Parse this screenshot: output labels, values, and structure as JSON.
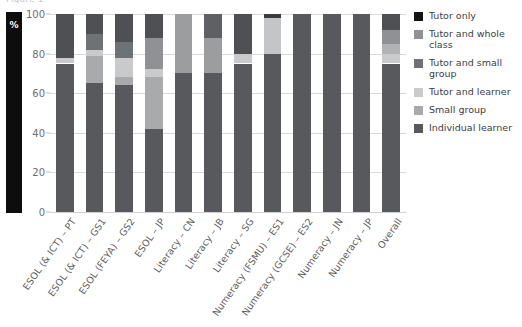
{
  "figure": {
    "caption_sliver": "Figure 1",
    "y_axis_title": "%"
  },
  "axis": {
    "y_ticks": [
      0,
      20,
      40,
      60,
      80,
      100
    ],
    "y_min": 0,
    "y_max": 100,
    "grid": true
  },
  "legend": {
    "position": "right",
    "entries": [
      {
        "label": "Tutor only",
        "color": "#141414"
      },
      {
        "label": "Tutor and whole\nclass",
        "color": "#8f9194"
      },
      {
        "label": "Tutor and small\ngroup",
        "color": "#6f7275"
      },
      {
        "label": "Tutor and learner",
        "color": "#c9cacb"
      },
      {
        "label": "Small group",
        "color": "#a8aaac"
      },
      {
        "label": "Individual learner",
        "color": "#58595c"
      }
    ]
  },
  "chart_data": {
    "type": "bar",
    "subtype": "stacked-percentage",
    "title": "",
    "subtitle": "",
    "xlabel": "",
    "ylabel": "%",
    "ylim": [
      0,
      100
    ],
    "grid": true,
    "legend_position": "right",
    "categories": [
      "ESOL (& ICT) – PT",
      "ESOL (& ICT) – GS1",
      "ESOL (FEYA) – GS2",
      "ESOL – JP",
      "Literacy – CN",
      "Literacy – JB",
      "Literacy – SG",
      "Numeracy (FSMU) – ES1",
      "Numeracy (GCSE) – ES2",
      "Numeracy – JN",
      "Numeracy – JP",
      "Overall"
    ],
    "series": [
      {
        "name": "Individual learner",
        "color": "#58595c",
        "values": [
          75,
          65,
          64,
          42,
          70,
          70,
          75,
          80,
          100,
          100,
          100,
          75
        ]
      },
      {
        "name": "Small group",
        "color": "#a8aaac",
        "values": [
          0,
          14,
          4,
          26,
          0,
          0,
          0,
          0,
          0,
          0,
          0,
          0
        ]
      },
      {
        "name": "Tutor and learner",
        "color": "#c9cacb",
        "values": [
          3,
          3,
          10,
          4,
          0,
          0,
          5,
          18,
          0,
          0,
          0,
          5
        ]
      },
      {
        "name": "Tutor and small group",
        "color": "#6f7275",
        "values": [
          0,
          8,
          8,
          16,
          0,
          18,
          0,
          0,
          0,
          0,
          0,
          5
        ]
      },
      {
        "name": "Tutor and whole class",
        "color": "#8f9194",
        "values": [
          0,
          0,
          0,
          0,
          30,
          0,
          0,
          0,
          0,
          0,
          0,
          7
        ]
      },
      {
        "name": "Tutor only",
        "color": "#141414",
        "values": [
          0,
          0,
          0,
          0,
          0,
          0,
          0,
          2,
          0,
          0,
          0,
          0
        ]
      },
      {
        "name": "Remainder (top dark)",
        "color": "#4f5053",
        "values": [
          22,
          10,
          14,
          12,
          0,
          12,
          20,
          0,
          0,
          0,
          0,
          8
        ]
      }
    ],
    "stack_order_bottom_to_top": [
      "Individual learner",
      "Small group",
      "Tutor and learner",
      "Tutor and small group",
      "Tutor and whole class",
      "Tutor only",
      "Remainder (top dark)"
    ],
    "bars": [
      {
        "category": "ESOL (& ICT) – PT",
        "segments": [
          {
            "from": 0,
            "to": 75,
            "color": "#58595c",
            "series": "Individual learner"
          },
          {
            "from": 75,
            "to": 78,
            "color": "#c9cacb",
            "series": "Tutor and learner"
          },
          {
            "from": 78,
            "to": 100,
            "color": "#4f5053",
            "series": "Tutor and small group"
          }
        ]
      },
      {
        "category": "ESOL (& ICT) – GS1",
        "segments": [
          {
            "from": 0,
            "to": 65,
            "color": "#58595c",
            "series": "Individual learner"
          },
          {
            "from": 65,
            "to": 79,
            "color": "#a8aaac",
            "series": "Small group"
          },
          {
            "from": 79,
            "to": 82,
            "color": "#c9cacb",
            "series": "Tutor and learner"
          },
          {
            "from": 82,
            "to": 90,
            "color": "#6f7275",
            "series": "Tutor and small group"
          },
          {
            "from": 90,
            "to": 100,
            "color": "#4f5053",
            "series": "Tutor and whole class"
          }
        ]
      },
      {
        "category": "ESOL (FEYA) – GS2",
        "segments": [
          {
            "from": 0,
            "to": 64,
            "color": "#58595c",
            "series": "Individual learner"
          },
          {
            "from": 64,
            "to": 68,
            "color": "#a8aaac",
            "series": "Small group"
          },
          {
            "from": 68,
            "to": 78,
            "color": "#c9cacb",
            "series": "Tutor and learner"
          },
          {
            "from": 78,
            "to": 86,
            "color": "#6f7275",
            "series": "Tutor and small group"
          },
          {
            "from": 86,
            "to": 100,
            "color": "#4f5053",
            "series": "Tutor and whole class"
          }
        ]
      },
      {
        "category": "ESOL – JP",
        "segments": [
          {
            "from": 0,
            "to": 42,
            "color": "#58595c",
            "series": "Individual learner"
          },
          {
            "from": 42,
            "to": 68,
            "color": "#a8aaac",
            "series": "Small group"
          },
          {
            "from": 68,
            "to": 72,
            "color": "#c9cacb",
            "series": "Tutor and learner"
          },
          {
            "from": 72,
            "to": 88,
            "color": "#8f9194",
            "series": "Tutor and whole class"
          },
          {
            "from": 88,
            "to": 100,
            "color": "#4f5053",
            "series": "Tutor and small group"
          }
        ]
      },
      {
        "category": "Literacy – CN",
        "segments": [
          {
            "from": 0,
            "to": 70,
            "color": "#58595c",
            "series": "Individual learner"
          },
          {
            "from": 70,
            "to": 100,
            "color": "#9b9d9f",
            "series": "Tutor and whole class"
          }
        ]
      },
      {
        "category": "Literacy – JB",
        "segments": [
          {
            "from": 0,
            "to": 70,
            "color": "#58595c",
            "series": "Individual learner"
          },
          {
            "from": 70,
            "to": 88,
            "color": "#9b9d9f",
            "series": "Tutor and small group"
          },
          {
            "from": 88,
            "to": 100,
            "color": "#5f6063",
            "series": "Tutor and whole class"
          }
        ]
      },
      {
        "category": "Literacy – SG",
        "segments": [
          {
            "from": 0,
            "to": 75,
            "color": "#58595c",
            "series": "Individual learner"
          },
          {
            "from": 75,
            "to": 80,
            "color": "#c9cacb",
            "series": "Tutor and learner"
          },
          {
            "from": 80,
            "to": 100,
            "color": "#4f5053",
            "series": "Tutor and small group"
          }
        ]
      },
      {
        "category": "Numeracy (FSMU) – ES1",
        "segments": [
          {
            "from": 0,
            "to": 80,
            "color": "#58595c",
            "series": "Individual learner"
          },
          {
            "from": 80,
            "to": 98,
            "color": "#c4c5c6",
            "series": "Tutor and learner"
          },
          {
            "from": 98,
            "to": 100,
            "color": "#3a3b3d",
            "series": "Tutor only"
          }
        ]
      },
      {
        "category": "Numeracy (GCSE) – ES2",
        "segments": [
          {
            "from": 0,
            "to": 100,
            "color": "#58595c",
            "series": "Individual learner"
          }
        ]
      },
      {
        "category": "Numeracy – JN",
        "segments": [
          {
            "from": 0,
            "to": 100,
            "color": "#58595c",
            "series": "Individual learner"
          }
        ]
      },
      {
        "category": "Numeracy – JP",
        "segments": [
          {
            "from": 0,
            "to": 100,
            "color": "#58595c",
            "series": "Individual learner"
          }
        ]
      },
      {
        "category": "Overall",
        "segments": [
          {
            "from": 0,
            "to": 75,
            "color": "#58595c",
            "series": "Individual learner"
          },
          {
            "from": 75,
            "to": 80,
            "color": "#c9cacb",
            "series": "Tutor and learner"
          },
          {
            "from": 80,
            "to": 85,
            "color": "#b0b2b4",
            "series": "Small group"
          },
          {
            "from": 85,
            "to": 92,
            "color": "#8f9194",
            "series": "Tutor and small group"
          },
          {
            "from": 92,
            "to": 100,
            "color": "#4f5053",
            "series": "Tutor and whole class"
          }
        ]
      }
    ]
  }
}
